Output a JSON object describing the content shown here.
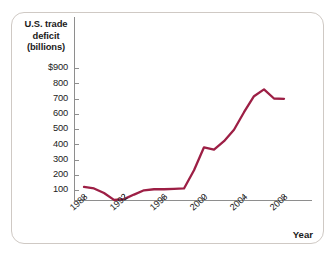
{
  "figure": {
    "y_axis_title_lines": [
      "U.S. trade",
      "deficit",
      "(billions)"
    ],
    "x_axis_title": "Year",
    "line_color": "#9d1f45",
    "axis_color": "#8e8e8e",
    "frame_color": "#cfc9c4",
    "background": "#ffffff"
  },
  "chart_data": {
    "type": "line",
    "title": "",
    "subtitle": "",
    "xlabel": "Year",
    "ylabel": "U.S. trade deficit (billions)",
    "xlim": [
      1987,
      2009
    ],
    "ylim": [
      0,
      900
    ],
    "grid": false,
    "legend": "none",
    "x_tick_labels": [
      "1988",
      "1992",
      "1996",
      "2000",
      "2004",
      "2008"
    ],
    "x_ticks": [
      1988,
      1992,
      1996,
      2000,
      2004,
      2008
    ],
    "y_tick_labels": [
      "$900",
      "800",
      "700",
      "600",
      "500",
      "400",
      "300",
      "200",
      "100"
    ],
    "y_ticks": [
      900,
      800,
      700,
      600,
      500,
      400,
      300,
      200,
      100
    ],
    "series": [
      {
        "name": "U.S. trade deficit",
        "color": "#9d1f45",
        "x": [
          1988,
          1989,
          1990,
          1991,
          1992,
          1993,
          1994,
          1995,
          1996,
          1997,
          1998,
          1999,
          2000,
          2001,
          2002,
          2003,
          2004,
          2005,
          2006,
          2007,
          2008
        ],
        "values": [
          120,
          110,
          80,
          35,
          40,
          70,
          98,
          105,
          105,
          108,
          110,
          230,
          380,
          365,
          420,
          495,
          610,
          715,
          760,
          700,
          698
        ]
      }
    ]
  }
}
